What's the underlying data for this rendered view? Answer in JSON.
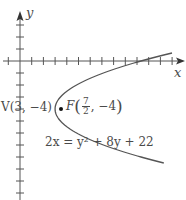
{
  "figure": {
    "axes": {
      "x_label": "x",
      "y_label": "y",
      "x_tick_spacing": 1,
      "y_tick_spacing": 1
    },
    "vertex": {
      "name": "V",
      "x": 3,
      "y": -4,
      "label": "V(3, −4)"
    },
    "focus": {
      "name": "F",
      "x": 3.5,
      "y": -4,
      "label_prefix": "F",
      "x_num": "7",
      "x_den": "2",
      "y_text": "−4"
    },
    "equation": "2x = y² + 8y + 22",
    "colors": {
      "curve": "#555555",
      "axes": "#555555",
      "text": "#4a4a4a",
      "background": "#ffffff"
    }
  },
  "chart_data": {
    "type": "line",
    "title": "",
    "xlabel": "x",
    "ylabel": "y",
    "curve": "parabola 2x = y^2 + 8y + 22 (x = (y+4)^2/2 + 3), opening right",
    "points": [
      {
        "label": "V",
        "x": 3,
        "y": -4
      },
      {
        "label": "F",
        "x": 3.5,
        "y": -4
      }
    ],
    "xlim": [
      -1.5,
      14
    ],
    "ylim": [
      -11.5,
      4
    ],
    "grid": false
  }
}
